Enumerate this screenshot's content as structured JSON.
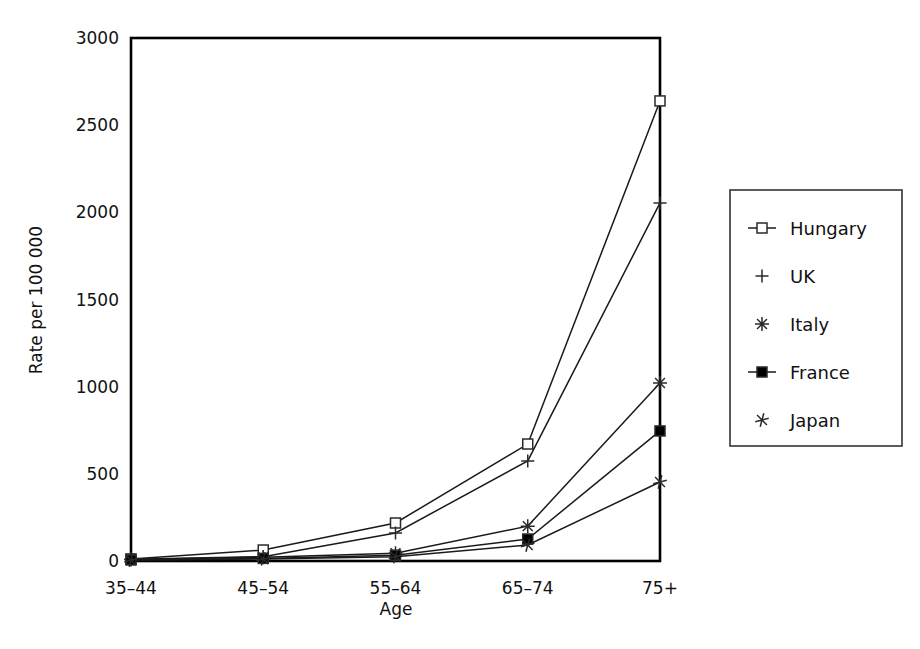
{
  "chart_data": {
    "type": "line",
    "title": "",
    "xlabel": "Age",
    "ylabel": "Rate per 100 000",
    "categories": [
      "35–44",
      "45–54",
      "55–64",
      "65–74",
      "75+"
    ],
    "ylim": [
      0,
      3000
    ],
    "yticks": [
      0,
      500,
      1000,
      1500,
      2000,
      2500,
      3000
    ],
    "ytick_labels": [
      "0",
      "500",
      "1000",
      "1500",
      "2000",
      "2500",
      "3000"
    ],
    "grid": false,
    "legend_position": "right-outside",
    "series": [
      {
        "name": "Hungary",
        "marker": "open-square",
        "values": [
          12,
          63,
          218,
          671,
          2639
        ]
      },
      {
        "name": "UK",
        "marker": "plus",
        "values": [
          10,
          25,
          161,
          574,
          2054
        ]
      },
      {
        "name": "Italy",
        "marker": "asterisk",
        "values": [
          8,
          22,
          45,
          200,
          1021
        ]
      },
      {
        "name": "France",
        "marker": "filled-square",
        "values": [
          6,
          15,
          33,
          126,
          746
        ]
      },
      {
        "name": "Japan",
        "marker": "x-star",
        "values": [
          5,
          12,
          25,
          92,
          453
        ]
      }
    ]
  },
  "legend": {
    "entries": [
      {
        "label": "Hungary"
      },
      {
        "label": "UK"
      },
      {
        "label": "Italy"
      },
      {
        "label": "France"
      },
      {
        "label": "Japan"
      }
    ]
  },
  "axes": {
    "y_title": "Rate per 100 000",
    "x_title": "Age"
  }
}
